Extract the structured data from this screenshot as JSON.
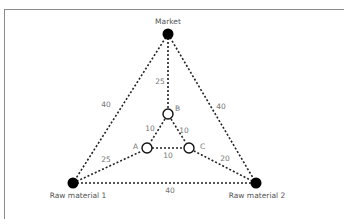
{
  "nodes": {
    "market": {
      "label": "Market",
      "type": "filled"
    },
    "raw1": {
      "label": "Raw material  1",
      "type": "filled"
    },
    "raw2": {
      "label": "Raw material  2",
      "type": "filled"
    },
    "a": {
      "label": "A",
      "type": "hollow"
    },
    "b": {
      "label": "B",
      "type": "hollow"
    },
    "c": {
      "label": "C",
      "type": "hollow"
    }
  },
  "edges": {
    "market_raw1": "40",
    "market_raw2": "40",
    "raw1_raw2": "40",
    "market_b": "25",
    "raw1_a": "25",
    "raw2_c": "20",
    "a_b": "10",
    "b_c": "10",
    "a_c": "10"
  }
}
